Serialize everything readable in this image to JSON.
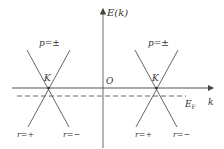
{
  "diagram": {
    "axes": {
      "y_label": "E(k)",
      "x_label": "k",
      "origin_label": "O"
    },
    "fermi_level": {
      "label_main": "E",
      "label_sub": "F"
    },
    "cones": [
      {
        "vertex_label": "K",
        "top_label": "p=±",
        "left_bottom_label": "r=+",
        "right_bottom_label": "r=−"
      },
      {
        "vertex_label": "K",
        "top_label": "p=±",
        "left_bottom_label": "r=+",
        "right_bottom_label": "r=−"
      }
    ],
    "colors": {
      "line": "#555555",
      "text": "#333333",
      "background": "#ffffff"
    }
  }
}
